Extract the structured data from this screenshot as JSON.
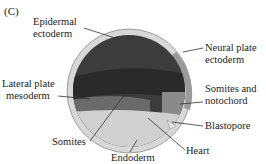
{
  "panel_label": "(C)",
  "labels": {
    "epidermal_1": "Epidermal",
    "epidermal_2": "ectoderm",
    "neural_1": "Neural plate",
    "neural_2": "ectoderm",
    "lateral_1": "Lateral plate",
    "lateral_2": "mesoderm",
    "somnoto_1": "Somites and",
    "somnoto_2": "notochord",
    "blastopore": "Blastopore",
    "somites": "Somites",
    "heart": "Heart",
    "endoderm": "Endoderm"
  },
  "colors": {
    "outer_ring": "#d8d8d8",
    "neural_ring": "#9a9a9a",
    "epidermal": "#3c3c3c",
    "band_dark": "#2a2a2a",
    "lateral": "#6a6a6a",
    "somites_block": "#8a8a8a",
    "endoderm": "#d0d0d0",
    "leader": "#333333"
  }
}
